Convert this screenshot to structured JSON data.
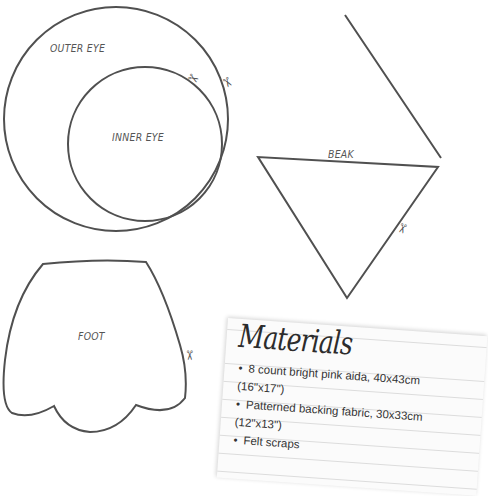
{
  "shapes": {
    "outer_eye": {
      "label": "OUTER EYE"
    },
    "inner_eye": {
      "label": "INNER EYE"
    },
    "beak": {
      "label": "BEAK"
    },
    "foot": {
      "label": "FOOT"
    }
  },
  "icons": {
    "scissors": "✂"
  },
  "colors": {
    "outline": "#505050",
    "label": "#555555",
    "card_bg": "#fbfbfb",
    "card_line": "#dcdcdc"
  },
  "materials": {
    "title": "Materials",
    "items": [
      {
        "text": "8 count bright pink aida, 40x43cm",
        "sub": "(16\"x17\")"
      },
      {
        "text": "Patterned backing fabric, 30x33cm",
        "sub": "(12\"x13\")"
      },
      {
        "text": "Felt scraps",
        "sub": ""
      }
    ]
  }
}
